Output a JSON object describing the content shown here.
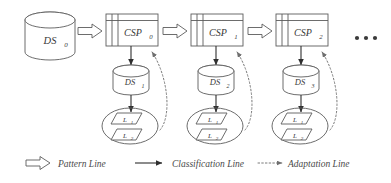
{
  "diagram": {
    "source_store": {
      "id": "ds0",
      "label": "DS",
      "sub": "0",
      "shape": "cylinder"
    },
    "stages": [
      {
        "csp": {
          "id": "csp0",
          "label": "CSP",
          "sub": "0",
          "shape": "window-box"
        },
        "store": {
          "id": "ds1",
          "label": "DS",
          "sub": "1",
          "shape": "cylinder"
        },
        "patterns": {
          "id": "patterns0",
          "shape": "ellipse",
          "items": [
            {
              "label": "L",
              "sub": "1"
            },
            {
              "label": "L",
              "sub": "2"
            }
          ]
        }
      },
      {
        "csp": {
          "id": "csp1",
          "label": "CSP",
          "sub": "1",
          "shape": "window-box"
        },
        "store": {
          "id": "ds2",
          "label": "DS",
          "sub": "2",
          "shape": "cylinder"
        },
        "patterns": {
          "id": "patterns1",
          "shape": "ellipse",
          "items": [
            {
              "label": "L",
              "sub": "1"
            },
            {
              "label": "L",
              "sub": "2"
            }
          ]
        }
      },
      {
        "csp": {
          "id": "csp2",
          "label": "CSP",
          "sub": "2",
          "shape": "window-box"
        },
        "store": {
          "id": "ds3",
          "label": "DS",
          "sub": "3",
          "shape": "cylinder"
        },
        "patterns": {
          "id": "patterns2",
          "shape": "ellipse",
          "items": [
            {
              "label": "L",
              "sub": "1"
            },
            {
              "label": "L",
              "sub": "2"
            }
          ]
        }
      }
    ],
    "continuation": {
      "id": "ellipsis",
      "label": "..."
    },
    "legend": {
      "items": [
        {
          "id": "pattern-line",
          "glyph": "hollow-arrow",
          "label": "Pattern Line"
        },
        {
          "id": "classification-line",
          "glyph": "solid-arrow",
          "label": "Classification Line"
        },
        {
          "id": "adaptation-line",
          "glyph": "dotted-arrow",
          "label": "Adaptation Line"
        }
      ]
    },
    "colors": {
      "outline": "#5c5c5c",
      "solid_line": "#2f2f2f",
      "dotted_line": "#7a7a7a",
      "text": "#3a3a3a",
      "background": "#ffffff"
    }
  }
}
